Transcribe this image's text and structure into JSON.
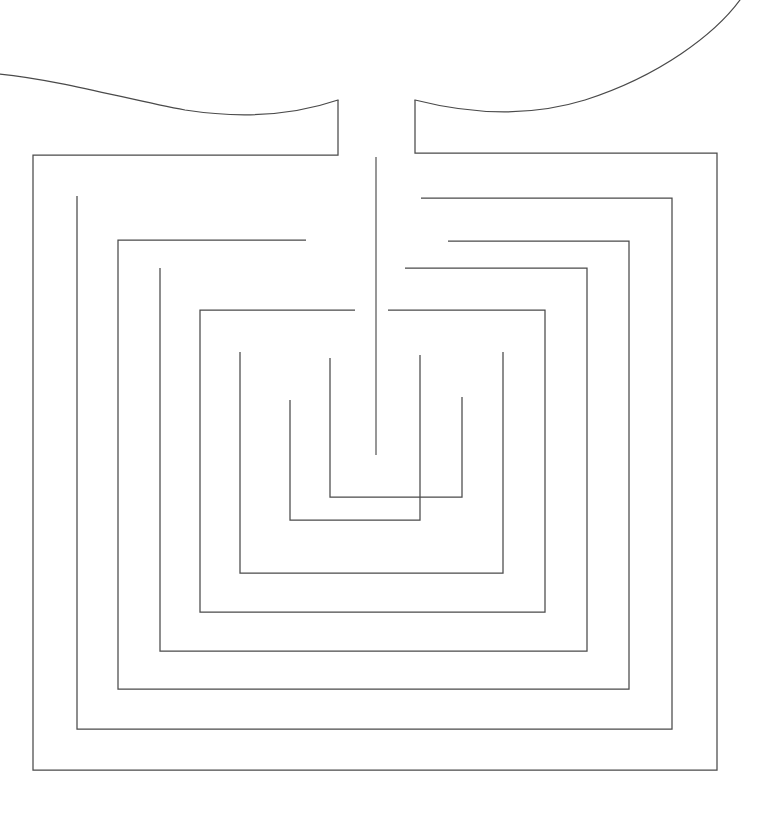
{
  "figure": {
    "kind": "line-drawing",
    "canvas": {
      "width": 763,
      "height": 828,
      "background": "#ffffff"
    },
    "stroke": {
      "color": "#4a4a4a",
      "width": 1.25
    },
    "center_axis_x": 376
  },
  "geometry": {
    "outer_rect": {
      "left": 33,
      "top": 153,
      "right": 717,
      "bottom": 770
    },
    "ring_left_x": [
      33,
      77,
      118,
      160,
      200,
      240
    ],
    "ring_right_x": [
      717,
      672,
      627,
      585,
      545,
      503
    ],
    "ring_top_y": [
      153,
      196,
      225,
      268,
      310
    ],
    "ring_bottom_y": [
      770,
      730,
      690,
      651,
      612,
      573
    ],
    "mouth": {
      "left_lip_x": 338,
      "right_lip_x": 415,
      "lip_top_y": 100,
      "lip_bottom_y": 155
    },
    "center_seam": {
      "x": 376,
      "y_top": 157,
      "y_bottom": 455
    }
  },
  "paths": {
    "decor_curve_left": "M 0,74 C 60,80 130,100 185,110 C 250,120 300,113 338,100",
    "decor_curve_right": "M 415,100 C 470,114 530,117 585,100 C 660,76 715,34 740,0",
    "ring_1": "M 338,100 L 338,155 L 33,155 L 33,770 L 717,770 L 717,153 L 415,153 L 415,100",
    "ring_2": "M 77,196 L 77,729 L 672,729 L 672,198 L 421,198",
    "ring_3": "M 306,240 L 118,240 L 118,689 L 629,689 L 629,241 L 448,241",
    "ring_4": "M 160,268 L 160,651 L 587,651 L 587,268 L 405,268",
    "ring_5": "M 355,310 L 200,310 L 200,612 L 545,612 L 545,310 L 388,310",
    "ring_6": "M 240,352 L 240,573 L 503,573 L 503,352",
    "inner_u_left": "M 290,400 L 290,520 L 420,520 L 420,355",
    "inner_u_right": "M 462,397 L 462,497 L 330,497 L 330,358",
    "center_seam": "M 376,157 L 376,455"
  },
  "layers": [
    {
      "name": "decorative-curve",
      "visible": true
    },
    {
      "name": "labyrinth-walls",
      "visible": true
    },
    {
      "name": "center-seam",
      "visible": true
    }
  ]
}
